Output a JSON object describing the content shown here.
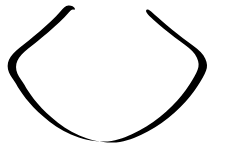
{
  "canvas": {
    "width": 228,
    "height": 148,
    "background_color": "#ffffff",
    "title": "Line Drawing"
  },
  "drawing": {
    "kind": "line-art-sketch",
    "subject": "open u-shaped neckline contour",
    "stroke_color": "#000000",
    "stroke_style": "tapered-brush",
    "stroke_width_max": 5,
    "stroke_width_min": 1,
    "path_count": 1,
    "closed": false,
    "endpoints": [
      {
        "name": "left-tip",
        "x": 73,
        "y": 10
      },
      {
        "name": "right-tip",
        "x": 148,
        "y": 10
      }
    ],
    "extrema": [
      {
        "name": "leftmost",
        "x": 16,
        "y": 62
      },
      {
        "name": "rightmost",
        "x": 207,
        "y": 78
      },
      {
        "name": "lowest",
        "x": 112,
        "y": 140
      }
    ],
    "outline_path": "M 73.5 9.5 C 72.0 9.0 70.6 10.4 69.0 12.2 C 63.4 18.6 56.0 25.6 48.0 32.4 C 40.0 39.2 33.0 44.6 28.0 48.8 C 23.0 53.0 19.2 56.8 17.4 60.8 C 15.6 64.8 15.6 69.4 17.4 73.4 C 19.2 77.4 22.2 80.8 24.4 84.8 C 26.6 88.8 29.6 93.6 34.0 99.2 C 38.4 104.8 44.4 111.2 52.0 117.8 C 59.6 124.4 68.8 131.0 79.4 135.6 C 90.0 140.2 102.0 142.8 112.4 142.6 C 122.8 142.4 131.6 139.4 140.8 135.0 C 150.0 130.6 159.6 124.8 168.2 118.0 C 176.8 111.2 184.4 103.4 190.2 96.2 C 196.0 89.0 200.0 82.4 202.8 77.4 C 205.6 72.4 207.2 69.0 207.0 65.0 C 206.8 61.0 204.8 56.4 200.6 52.0 C 196.4 47.6 190.0 43.4 183.0 38.2 C 176.0 33.0 168.4 26.8 161.6 20.8 C 154.8 14.8 149.6 9.8 147.8 9.5 C 146.0 9.2 145.6 10.8 146.6 12.6 C 147.6 14.4 150.0 16.8 153.4 19.8 C 160.0 25.8 167.6 32.0 174.6 37.2 C 181.6 42.4 188.0 46.6 192.2 51.0 C 196.4 55.4 198.4 60.0 198.6 64.0 C 198.8 68.0 197.2 71.4 194.4 76.4 C 191.6 81.4 187.6 88.0 181.8 95.2 C 176.0 102.4 168.4 110.2 159.8 117.0 C 151.2 123.8 141.6 129.6 132.4 134.0 C 123.2 138.4 114.4 141.4 104.0 141.6 C 93.6 141.8 81.6 139.2 71.0 134.6 C 60.4 130.0 51.2 123.4 43.6 116.8 C 36.0 110.2 30.0 103.8 25.6 98.2 C 21.2 92.6 18.2 87.8 16.0 83.8 C 13.8 79.8 10.8 76.4 9.0 72.4 C 7.2 68.4 7.2 63.8 9.0 59.8 C 10.8 55.8 14.6 52.0 19.6 47.8 C 24.6 43.6 31.6 38.2 39.6 31.4 C 47.6 24.6 55.0 17.6 60.6 11.2 C 63.4 8.0 65.4 5.6 68.4 5.4 C 71.4 5.2 74.0 6.6 74.6 8.0 C 75.2 9.4 75.0 10.0 73.5 9.5 Z"
  }
}
